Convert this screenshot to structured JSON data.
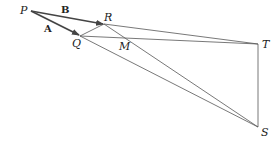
{
  "diagram": {
    "type": "geometry-vectors",
    "points": {
      "P": {
        "label": "P",
        "x": 31,
        "y": 11
      },
      "R": {
        "label": "R",
        "x": 104,
        "y": 24
      },
      "Q": {
        "label": "Q",
        "x": 80,
        "y": 36
      },
      "T": {
        "label": "T",
        "x": 258,
        "y": 44
      },
      "S": {
        "label": "S",
        "x": 258,
        "y": 127
      },
      "M": {
        "label": "M"
      }
    },
    "vectors": [
      {
        "label": "B",
        "from": "P",
        "to": "R"
      },
      {
        "label": "A",
        "from": "P",
        "to": "Q"
      }
    ],
    "segments": [
      [
        "Q",
        "R"
      ],
      [
        "R",
        "T"
      ],
      [
        "Q",
        "T"
      ],
      [
        "R",
        "S"
      ],
      [
        "Q",
        "S"
      ],
      [
        "T",
        "S"
      ]
    ],
    "colors": {
      "line": "#555555",
      "vector": "#444444",
      "text": "#222222"
    }
  }
}
